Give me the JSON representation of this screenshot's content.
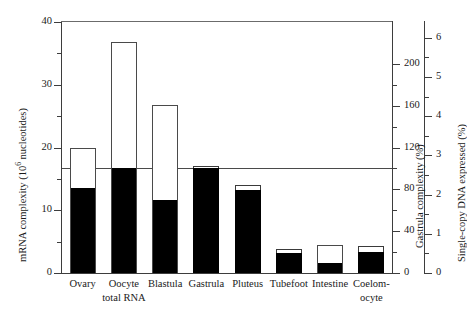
{
  "chart_data": {
    "type": "bar",
    "title": "",
    "xlabel": "",
    "ylabel": "mRNA complexity (10⁶ nucleotides)",
    "ylim": [
      0,
      40
    ],
    "grid": false,
    "legend": "none",
    "categories": [
      "Ovary",
      "Oocyte total RNA",
      "Blastula",
      "Gastrula",
      "Pluteus",
      "Tubefoot",
      "Intestine",
      "Coelomocyte"
    ],
    "series": [
      {
        "name": "Total mRNA complexity (open bar)",
        "style": "open",
        "values": [
          19.9,
          36.8,
          26.8,
          16.7,
          13.8,
          3.7,
          4.5,
          4.2
        ]
      },
      {
        "name": "Filled portion (solid black bar)",
        "style": "filled",
        "values": [
          13.5,
          16.7,
          11.6,
          16.7,
          13.2,
          3.2,
          1.6,
          3.3
        ]
      }
    ],
    "reference_line": {
      "value": 16.7,
      "label": "Gastrula 100% level",
      "axis": "left"
    },
    "axes": {
      "left": {
        "label": "mRNA complexity (10⁶ nucleotides)",
        "ticks": [
          0,
          10,
          20,
          30,
          40
        ],
        "minor_ticks": [
          5,
          15,
          25,
          35
        ],
        "range": [
          0,
          40
        ]
      },
      "right_inner": {
        "label": "Gastrula complexity (%)",
        "ticks": [
          0,
          40,
          80,
          120,
          160,
          200
        ],
        "minor_ticks": [
          20,
          60,
          100,
          140,
          180
        ],
        "range": [
          0,
          240
        ]
      },
      "right_outer": {
        "label": "Single-copy DNA expressed (%)",
        "ticks": [
          0,
          1,
          2,
          3,
          4,
          5,
          6
        ],
        "minor_ticks": [
          0.5,
          1.5,
          2.5,
          3.5,
          4.5,
          5.5
        ],
        "range": [
          0,
          6.4
        ]
      }
    },
    "x_tick_labels": [
      {
        "lines": [
          "Ovary"
        ]
      },
      {
        "lines": [
          "Oocyte",
          "total RNA"
        ]
      },
      {
        "lines": [
          "Blastula"
        ]
      },
      {
        "lines": [
          "Gastrula"
        ]
      },
      {
        "lines": [
          "Pluteus"
        ]
      },
      {
        "lines": [
          "Tubefoot"
        ]
      },
      {
        "lines": [
          "Intestine"
        ]
      },
      {
        "lines": [
          "Coelom-",
          "ocyte"
        ]
      }
    ],
    "colors": {
      "bar_filled": "#000000",
      "bar_open": "#ffffff",
      "bar_outline": "#4a4a4a",
      "axis": "#3d3d3d",
      "background": "#ffffff",
      "text": "#1a1a1a"
    }
  },
  "axis_labels": {
    "left_title": "mRNA complexity (10",
    "left_title_sup": "6",
    "left_title_tail": " nucleotides)",
    "right_inner_title": "Gastrula complexity (%)",
    "right_outer_title": "Single-copy DNA expressed (%)"
  },
  "tick_text": {
    "left": [
      "40",
      "30",
      "20",
      "10",
      "0"
    ],
    "right_inner": [
      "200",
      "160",
      "120",
      "80",
      "40",
      "0"
    ],
    "right_outer": [
      "6",
      "5",
      "4",
      "3",
      "2",
      "1",
      "0"
    ]
  }
}
